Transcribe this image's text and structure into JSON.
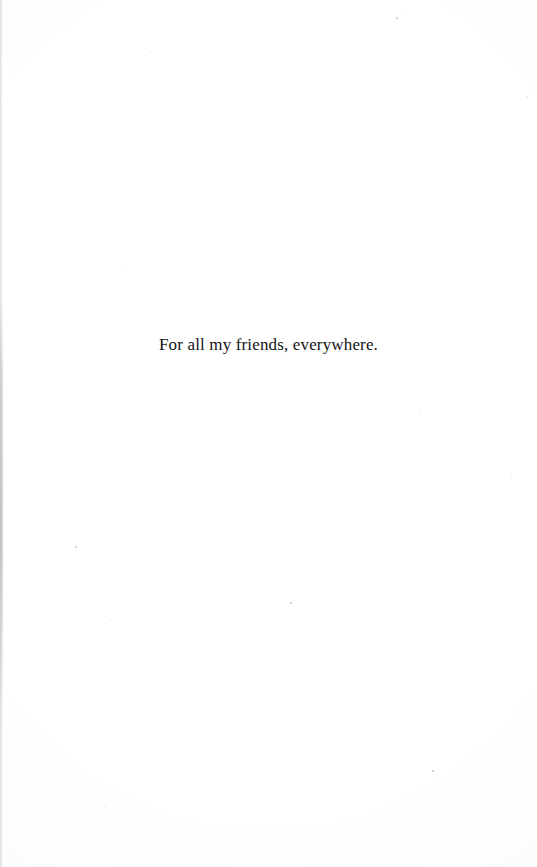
{
  "page": {
    "kind": "book-dedication-page",
    "width": 537,
    "height": 867,
    "background_color": "#ffffff",
    "text_color": "#141414"
  },
  "dedication": {
    "text": "For all my friends, everywhere."
  },
  "artifacts": {
    "gutter_shadow_color": "#787d82",
    "speck_color": "#c9cbcd",
    "specks": [
      {
        "x": 396,
        "y": 17,
        "size": 1.6
      },
      {
        "x": 402,
        "y": 13,
        "size": 1.2
      },
      {
        "x": 527,
        "y": 96,
        "size": 1.4
      },
      {
        "x": 150,
        "y": 51,
        "size": 1.2
      },
      {
        "x": 121,
        "y": 266,
        "size": 1.3
      },
      {
        "x": 420,
        "y": 409,
        "size": 1.2
      },
      {
        "x": 511,
        "y": 477,
        "size": 1.2
      },
      {
        "x": 75,
        "y": 546,
        "size": 1.6
      },
      {
        "x": 290,
        "y": 602,
        "size": 1.5
      },
      {
        "x": 110,
        "y": 620,
        "size": 1.2
      },
      {
        "x": 432,
        "y": 770,
        "size": 1.6
      },
      {
        "x": 105,
        "y": 806,
        "size": 1.2
      },
      {
        "x": 58,
        "y": 826,
        "size": 1.1
      }
    ]
  }
}
